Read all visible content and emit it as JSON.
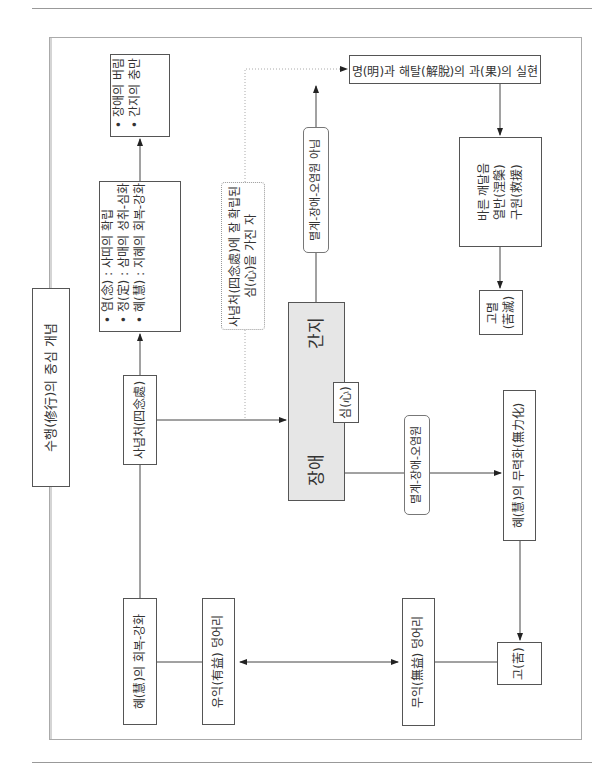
{
  "title": "수행(修行)의 중심 개념",
  "nodes": {
    "abandon_fill": [
      "장애의 버림",
      "간지의 충만"
    ],
    "three_training": [
      "염(念) : 사띠의 확립",
      "정(定) : 삼매의 성취-심화",
      "혜(慧) : 지혜의 회복-강화"
    ],
    "satipatthana": "사념처(四念處)",
    "established_mind": [
      "사념처(四念處)에 잘 확립된",
      "심(心)을 가진 자"
    ],
    "hindrance": "장애",
    "ganji": "간지",
    "mind": "심(心)",
    "label_not_defiled": "멸계-장애-오염원 아님",
    "label_defiled": "멸계-장애-오염원",
    "wisdom_liberation": "명(明)과 해탈(解脫)의 과(果)의 실현",
    "right_awakening": [
      "바른 깨달음",
      "열반(涅槃)",
      "구원(救援)"
    ],
    "cessation": [
      "고멸",
      "(苦滅)"
    ],
    "wisdom_restore": "혜(慧)의 회복-강화",
    "beneficial": "유익(有益) 덩어리",
    "wisdom_disable": "혜(慧)의 무력화(無力化)",
    "unbeneficial": "무익(無益) 덩어리",
    "suffering": "고(苦)"
  }
}
